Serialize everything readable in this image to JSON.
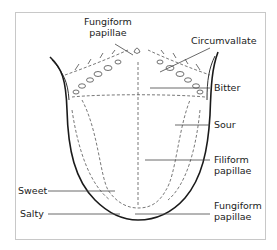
{
  "figure": {
    "labels": {
      "fungiform_top": {
        "line1": "Fungiform",
        "line2": "papillae"
      },
      "circumvallate": "Circumvallate",
      "bitter": "Bitter",
      "sour": "Sour",
      "filiform": {
        "line1": "Filiform",
        "line2": "papillae"
      },
      "sweet": "Sweet",
      "salty": "Salty",
      "fungiform_bottom": {
        "line1": "Fungiform",
        "line2": "papillae"
      }
    },
    "colors": {
      "outline": "#1a1a1a",
      "dashed": "#555555",
      "leader": "#444444",
      "frame": "#c8c8c8"
    }
  }
}
